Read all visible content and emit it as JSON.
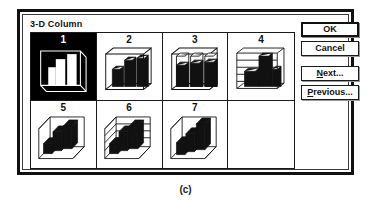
{
  "dialog": {
    "group_title": "3-D Column",
    "selected_index": 1
  },
  "buttons": [
    {
      "id": "ok",
      "label": "OK",
      "accel": "",
      "default": true
    },
    {
      "id": "cancel",
      "label": "Cancel",
      "accel": "",
      "default": false
    },
    {
      "id": "next",
      "label": "Next...",
      "accel": "N",
      "default": false
    },
    {
      "id": "previous",
      "label": "Previous...",
      "accel": "P",
      "default": false
    }
  ],
  "gallery": {
    "items": [
      {
        "number": "1",
        "name": "3d-column-clustered",
        "selected": true
      },
      {
        "number": "2",
        "name": "3d-column-stacked",
        "selected": false
      },
      {
        "number": "3",
        "name": "3d-column-100-percent",
        "selected": false
      },
      {
        "number": "4",
        "name": "3d-area-ribbon",
        "selected": false
      },
      {
        "number": "5",
        "name": "3d-column-perspective",
        "selected": false
      },
      {
        "number": "6",
        "name": "3d-column-perspective-grid",
        "selected": false
      },
      {
        "number": "7",
        "name": "3d-column-perspective-wall",
        "selected": false
      },
      {
        "number": "",
        "name": "empty-slot",
        "selected": false
      }
    ]
  },
  "caption": "(c)",
  "colors": {
    "ink": "#111111",
    "paper": "#ffffff",
    "selection": "#000000"
  },
  "chart_data": {
    "type": "bar",
    "title": "3-D Column",
    "note": "Chart-type gallery thumbnails; each preview depicts illustrative column series.",
    "previews": [
      {
        "number": "1",
        "subtype": "3-D Column (clustered)",
        "series": [
          {
            "name": "Series 1",
            "values": [
              45,
              70,
              95
            ]
          }
        ],
        "categories": [
          "1",
          "2",
          "3"
        ],
        "inverted": true
      },
      {
        "number": "2",
        "subtype": "3-D Column (stacked)",
        "series": [
          {
            "name": "Series 1",
            "values": [
              55,
              80,
              92
            ]
          }
        ],
        "categories": [
          "1",
          "2",
          "3"
        ],
        "inverted": false
      },
      {
        "number": "3",
        "subtype": "3-D Column (100%)",
        "series": [
          {
            "name": "Series 1",
            "values": [
              62,
              70,
              78
            ]
          }
        ],
        "categories": [
          "1",
          "2",
          "3"
        ],
        "inverted": false
      },
      {
        "number": "4",
        "subtype": "3-D Area / Ribbon",
        "series": [
          {
            "name": "Series 1",
            "values": [
              40,
              85,
              60
            ]
          }
        ],
        "categories": [
          "1",
          "2",
          "3"
        ],
        "inverted": false
      },
      {
        "number": "5",
        "subtype": "3-D Column (perspective)",
        "series": [
          {
            "name": "Series 1",
            "values": [
              35,
              65,
              90
            ]
          }
        ],
        "categories": [
          "1",
          "2",
          "3"
        ],
        "inverted": false
      },
      {
        "number": "6",
        "subtype": "3-D Column (gridlines)",
        "series": [
          {
            "name": "Series 1",
            "values": [
              35,
              65,
              90
            ]
          }
        ],
        "categories": [
          "1",
          "2",
          "3"
        ],
        "inverted": false
      },
      {
        "number": "7",
        "subtype": "3-D Column (wall grid)",
        "series": [
          {
            "name": "Series 1",
            "values": [
              35,
              60,
              95
            ]
          }
        ],
        "categories": [
          "1",
          "2",
          "3"
        ],
        "inverted": false
      }
    ]
  }
}
